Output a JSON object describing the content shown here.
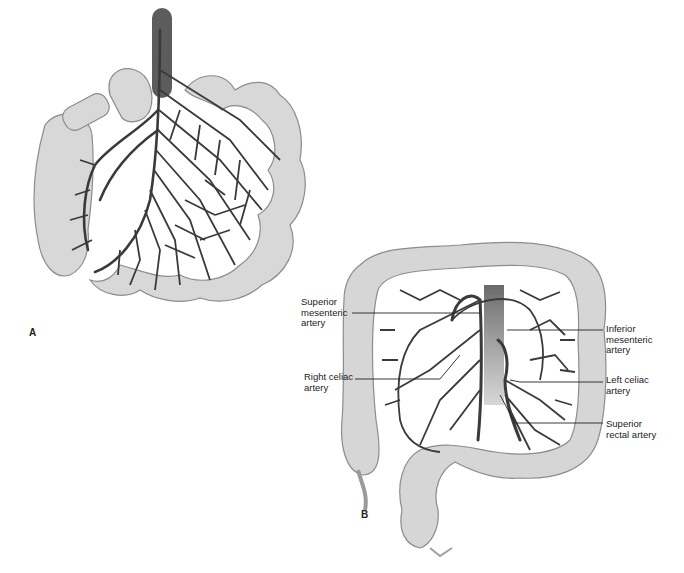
{
  "figure": {
    "panels": [
      {
        "label": "A",
        "description": "Small intestine mesentery with arterial arcades"
      },
      {
        "label": "B",
        "description": "Colon with mesenteric and celiac arteries"
      }
    ],
    "callouts": [
      {
        "text": "Superior\nmesenteric\nartery",
        "side": "left"
      },
      {
        "text": "Right celiac\nartery",
        "side": "left"
      },
      {
        "text": "Inferior\nmesenteric\nartery",
        "side": "right"
      },
      {
        "text": "Left celiac\nartery",
        "side": "right"
      },
      {
        "text": "Superior\nrectal artery",
        "side": "right"
      }
    ],
    "colors": {
      "bowel_fill": "#d6d6d6",
      "bowel_stroke": "#8a8a8a",
      "artery": "#3a3a3a",
      "aorta": "#5a5a5a",
      "background": "#ffffff"
    }
  }
}
